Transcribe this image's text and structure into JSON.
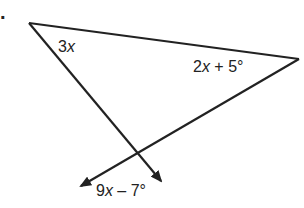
{
  "problem": {
    "number_fragment": "."
  },
  "figure": {
    "type": "triangle with extended sides",
    "vertices": {
      "top_left": [
        29,
        23
      ],
      "right": [
        299,
        59
      ]
    },
    "rays": {
      "from_top_left_arrow_tip": [
        163,
        183
      ],
      "from_right_arrow_tip": [
        79,
        187
      ],
      "intersection": [
        138,
        155
      ]
    },
    "stroke_color": "#222222"
  },
  "labels": {
    "angle_top_left": {
      "coef": "3",
      "var": "x",
      "suffix": ""
    },
    "angle_right": {
      "coef": "2",
      "var": "x",
      "suffix": " + 5°"
    },
    "angle_bottom": {
      "coef": "9",
      "var": "x",
      "suffix": " – 7°"
    }
  }
}
